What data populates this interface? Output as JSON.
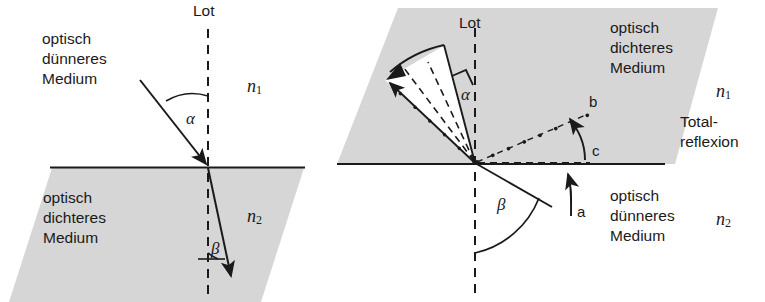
{
  "figure": {
    "title_hidden": "Brechung und Totalreflexion",
    "colors": {
      "medium_fill": "#d6d6d6",
      "white_fill": "#ffffff",
      "stroke": "#1a1a1a",
      "background": "#ffffff"
    }
  },
  "left_diagram": {
    "name": "refraction",
    "normal_label": "Lot",
    "upper_medium_line1": "optisch",
    "upper_medium_line2": "dünneres",
    "upper_medium_line3": "Medium",
    "lower_medium_line1": "optisch",
    "lower_medium_line2": "dichteres",
    "lower_medium_line3": "Medium",
    "index_upper": "n",
    "index_upper_sub": "1",
    "index_lower": "n",
    "index_lower_sub": "2",
    "angle_incidence": "α",
    "angle_refraction": "β"
  },
  "right_diagram": {
    "name": "total-reflection",
    "normal_label": "Lot",
    "upper_medium_line1": "optisch",
    "upper_medium_line2": "dichteres",
    "upper_medium_line3": "Medium",
    "lower_medium_line1": "optisch",
    "lower_medium_line2": "dünneres",
    "lower_medium_line3": "Medium",
    "index_upper": "n",
    "index_upper_sub": "1",
    "index_lower": "n",
    "index_lower_sub": "2",
    "phenomenon_line1": "Total-",
    "phenomenon_line2": "reflexion",
    "angle_reflection": "α",
    "angle_incidence": "β",
    "ray_a": "a",
    "ray_b": "b",
    "ray_c": "c"
  }
}
